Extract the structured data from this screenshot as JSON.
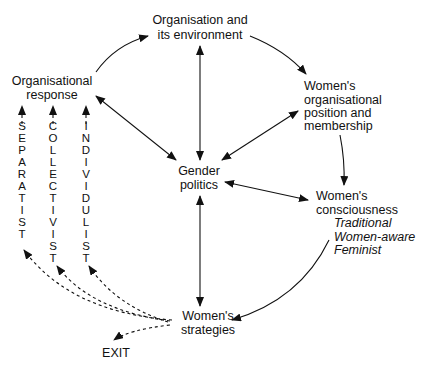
{
  "diagram": {
    "nodes": {
      "environment": {
        "lines": [
          "Organisation and",
          "its environment"
        ]
      },
      "response": {
        "lines": [
          "Organisational",
          "response"
        ]
      },
      "position": {
        "lines": [
          "Women's",
          "organisational",
          "position and",
          "membership"
        ]
      },
      "gender": {
        "lines": [
          "Gender",
          "politics"
        ]
      },
      "consciousness": {
        "lines": [
          "Women's",
          "consciousness"
        ],
        "types": [
          "Traditional",
          "Women-aware",
          "Feminist"
        ]
      },
      "strategies": {
        "lines": [
          "Women's",
          "strategies"
        ]
      },
      "exit": {
        "label": "EXIT"
      }
    },
    "strategy_types": [
      {
        "label": "SEPARATIST",
        "letters": [
          "S",
          "E",
          "P",
          "A",
          "R",
          "A",
          "T",
          "I",
          "S",
          "T"
        ]
      },
      {
        "label": "COLLECTIVIST",
        "letters": [
          "C",
          "O",
          "L",
          "L",
          "E",
          "C",
          "T",
          "I",
          "V",
          "I",
          "S",
          "T"
        ]
      },
      {
        "label": "INDIVIDULIST",
        "letters": [
          "I",
          "N",
          "D",
          "I",
          "V",
          "I",
          "D",
          "U",
          "L",
          "I",
          "S",
          "T"
        ]
      }
    ],
    "edges": [
      {
        "from": "response",
        "to": "environment",
        "style": "solid",
        "direction": "one-way"
      },
      {
        "from": "environment",
        "to": "position",
        "style": "solid",
        "direction": "one-way"
      },
      {
        "from": "position",
        "to": "consciousness",
        "style": "solid",
        "direction": "one-way"
      },
      {
        "from": "consciousness",
        "to": "strategies",
        "style": "solid",
        "direction": "one-way"
      },
      {
        "from": "environment",
        "to": "gender",
        "style": "solid",
        "direction": "two-way"
      },
      {
        "from": "response",
        "to": "gender",
        "style": "solid",
        "direction": "two-way"
      },
      {
        "from": "position",
        "to": "gender",
        "style": "solid",
        "direction": "two-way"
      },
      {
        "from": "consciousness",
        "to": "gender",
        "style": "solid",
        "direction": "two-way"
      },
      {
        "from": "strategies",
        "to": "gender",
        "style": "solid",
        "direction": "two-way"
      },
      {
        "from": "strategies",
        "to": "SEPARATIST",
        "style": "dashed",
        "direction": "one-way"
      },
      {
        "from": "strategies",
        "to": "COLLECTIVIST",
        "style": "dashed",
        "direction": "one-way"
      },
      {
        "from": "strategies",
        "to": "INDIVIDULIST",
        "style": "dashed",
        "direction": "one-way"
      },
      {
        "from": "strategies",
        "to": "exit",
        "style": "dashed",
        "direction": "one-way"
      },
      {
        "from": "SEPARATIST",
        "to": "response",
        "style": "dashed",
        "direction": "one-way"
      },
      {
        "from": "COLLECTIVIST",
        "to": "response",
        "style": "dashed",
        "direction": "one-way"
      },
      {
        "from": "INDIVIDULIST",
        "to": "response",
        "style": "dashed",
        "direction": "one-way"
      }
    ]
  }
}
